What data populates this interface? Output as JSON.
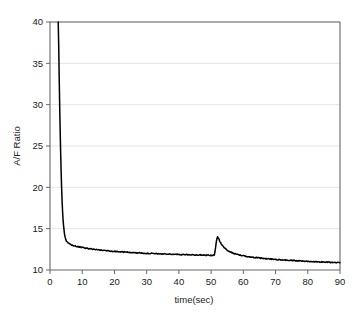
{
  "chart_data": {
    "type": "line",
    "title": "",
    "xlabel": "time(sec)",
    "ylabel": "A/F Ratio",
    "xlim": [
      0,
      90
    ],
    "ylim": [
      10,
      40
    ],
    "xticks": [
      0,
      10,
      20,
      30,
      40,
      50,
      60,
      70,
      80,
      90
    ],
    "yticks": [
      10,
      15,
      20,
      25,
      30,
      35,
      40
    ],
    "grid": "horizontal",
    "legend": "none",
    "series": [
      {
        "name": "A/F Ratio",
        "color": "#000000",
        "x": [
          2.55,
          2.7,
          2.85,
          3.0,
          3.15,
          3.3,
          3.45,
          3.6,
          3.75,
          3.9,
          4.05,
          4.2,
          4.35,
          4.5,
          4.7,
          4.9,
          5.1,
          5.3,
          5.5,
          5.8,
          6.1,
          6.4,
          6.8,
          7.2,
          7.6,
          8.0,
          8.5,
          9.0,
          9.5,
          10.0,
          10.5,
          11.0,
          11.5,
          12.0,
          12.5,
          13.0,
          13.5,
          14.0,
          15.0,
          16.0,
          17.0,
          18.0,
          19.0,
          20.0,
          21.0,
          22.0,
          23.0,
          24.0,
          25.0,
          26.0,
          27.0,
          28.0,
          29.0,
          30.0,
          31.0,
          32.0,
          33.0,
          34.0,
          35.0,
          36.0,
          37.0,
          38.0,
          39.0,
          40.0,
          41.0,
          42.0,
          43.0,
          44.0,
          45.0,
          46.0,
          47.0,
          48.0,
          49.0,
          50.0,
          50.6,
          51.0,
          51.2,
          51.4,
          51.6,
          51.8,
          52.0,
          52.2,
          52.5,
          52.8,
          53.2,
          53.6,
          54.0,
          54.5,
          55.0,
          55.5,
          56.0,
          57.0,
          58.0,
          59.0,
          60.0,
          61.0,
          62.0,
          63.0,
          64.0,
          65.0,
          66.0,
          67.0,
          68.0,
          69.0,
          70.0,
          71.0,
          72.0,
          73.0,
          74.0,
          75.0,
          76.0,
          77.0,
          78.0,
          79.0,
          80.0,
          81.0,
          82.0,
          83.0,
          84.0,
          85.0,
          86.0,
          87.0,
          88.0,
          89.0,
          90.0
        ],
        "y": [
          40.0,
          37.2,
          33.4,
          30.0,
          27.0,
          24.3,
          22.0,
          20.0,
          18.4,
          17.1,
          16.1,
          15.4,
          14.8,
          14.35,
          13.95,
          13.7,
          13.5,
          13.38,
          13.3,
          13.2,
          13.14,
          13.08,
          13.02,
          12.96,
          12.92,
          12.88,
          12.83,
          12.79,
          12.75,
          12.72,
          12.68,
          12.65,
          12.62,
          12.59,
          12.56,
          12.54,
          12.51,
          12.49,
          12.44,
          12.4,
          12.36,
          12.32,
          12.29,
          12.26,
          12.23,
          12.2,
          12.17,
          12.15,
          12.12,
          12.1,
          12.08,
          12.06,
          12.04,
          12.02,
          12.0,
          11.99,
          11.97,
          11.96,
          11.94,
          11.93,
          11.92,
          11.9,
          11.89,
          11.88,
          11.87,
          11.86,
          11.85,
          11.84,
          11.83,
          11.82,
          11.81,
          11.8,
          11.79,
          11.78,
          11.78,
          11.82,
          12.2,
          12.8,
          13.35,
          13.75,
          13.98,
          13.9,
          13.65,
          13.4,
          13.12,
          12.9,
          12.72,
          12.55,
          12.4,
          12.28,
          12.18,
          12.02,
          11.9,
          11.8,
          11.72,
          11.65,
          11.59,
          11.54,
          11.49,
          11.45,
          11.41,
          11.37,
          11.34,
          11.31,
          11.28,
          11.25,
          11.22,
          11.2,
          11.17,
          11.15,
          11.13,
          11.11,
          11.09,
          11.07,
          11.05,
          11.03,
          11.01,
          11.0,
          10.98,
          10.96,
          10.95,
          10.93,
          10.92,
          10.9,
          10.89
        ],
        "noise_amplitude": 0.055
      }
    ],
    "annotations": [
      {
        "name": "initial-decay",
        "description": "Steep exponential drop from 40 to ~13.3 between t=2.5 and t=5"
      },
      {
        "name": "spike",
        "description": "Transient spike to ~14.0 at t=52",
        "x": 52.0,
        "y": 13.98
      },
      {
        "name": "final-value",
        "description": "Curve settles near 10.9 at t=90",
        "x": 90.0,
        "y": 10.89
      }
    ]
  },
  "axes": {
    "x_tick_labels": [
      "0",
      "10",
      "20",
      "30",
      "40",
      "50",
      "60",
      "70",
      "80",
      "90"
    ],
    "y_tick_labels": [
      "10",
      "15",
      "20",
      "25",
      "30",
      "35",
      "40"
    ],
    "x_axis_title": "time(sec)",
    "y_axis_title": "A/F Ratio"
  },
  "colors": {
    "background": "#ffffff",
    "line": "#000000",
    "grid": "#d8d8d8",
    "axis": "#666666",
    "text": "#1a1a1a"
  }
}
